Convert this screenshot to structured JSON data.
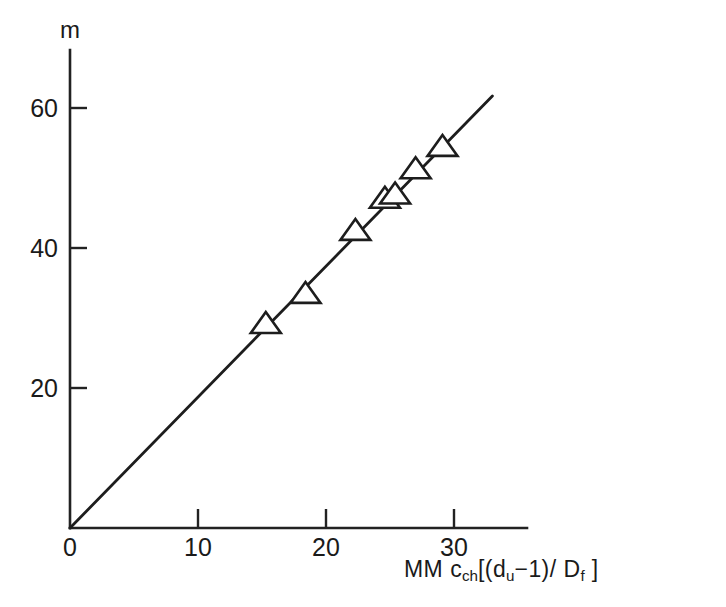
{
  "chart_data": {
    "type": "scatter",
    "title": "",
    "xlabel": "MM c_ch[(d_u-1)/D_f]",
    "ylabel": "m",
    "xlim": [
      0,
      35.7
    ],
    "ylim": [
      0,
      68.3
    ],
    "xticks": [
      0,
      10,
      20,
      30
    ],
    "yticks": [
      20,
      40,
      60
    ],
    "xtick_labels": [
      "0",
      "10",
      "20",
      "30"
    ],
    "ytick_labels": [
      "20",
      "40",
      "60"
    ],
    "grid": false,
    "legend": null,
    "marker_style": "open-triangle-up",
    "points": [
      {
        "x": 15.3,
        "y": 29.0
      },
      {
        "x": 18.4,
        "y": 33.3
      },
      {
        "x": 22.3,
        "y": 42.3
      },
      {
        "x": 24.6,
        "y": 46.9
      },
      {
        "x": 25.4,
        "y": 47.5
      },
      {
        "x": 27.0,
        "y": 51.1
      },
      {
        "x": 29.1,
        "y": 54.3
      }
    ],
    "fit_line": {
      "x": [
        0,
        33.0
      ],
      "y": [
        0,
        61.7
      ],
      "slope": 1.87,
      "intercept": 0
    }
  },
  "axis_labels": {
    "y_axis_name": "m",
    "x_axis_parts": {
      "prefix": "MM",
      "coefficient": "c",
      "coefficient_sub": "ch",
      "bracket_open": "[(",
      "d_symbol": "d",
      "d_sub": "u",
      "minus_one": "−1)/",
      "D_symbol": "D",
      "D_sub": "f",
      "bracket_close": "]"
    }
  }
}
